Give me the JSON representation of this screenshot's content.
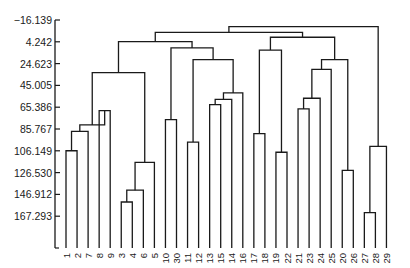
{
  "chart_data": {
    "type": "dendrogram",
    "title": "",
    "xlabel": "",
    "ylabel": "",
    "y_axis": {
      "ticks": [
        "-16.139",
        "4.242",
        "24.623",
        "45.005",
        "65.386",
        "85.767",
        "106.149",
        "126.530",
        "146.912",
        "167.293"
      ],
      "inverted": true,
      "range": [
        -16.139,
        193
      ]
    },
    "leaves": [
      "1",
      "2",
      "7",
      "8",
      "9",
      "3",
      "4",
      "6",
      "5",
      "10",
      "30",
      "11",
      "12",
      "13",
      "15",
      "14",
      "16",
      "17",
      "18",
      "19",
      "22",
      "21",
      "23",
      "24",
      "25",
      "20",
      "26",
      "27",
      "28",
      "29"
    ],
    "merges": [
      {
        "id": "a",
        "left": "L0",
        "right": "L1",
        "height": 106.1
      },
      {
        "id": "b",
        "left": "a",
        "right": "L2",
        "height": 88.0
      },
      {
        "id": "c",
        "left": "L5",
        "right": "L6",
        "height": 154.0
      },
      {
        "id": "d",
        "left": "c",
        "right": "L7",
        "height": 143.0
      },
      {
        "id": "e",
        "left": "d",
        "right": "L8",
        "height": 117.0
      },
      {
        "id": "f",
        "left": "L3",
        "right": "L4",
        "height": 68.5
      },
      {
        "id": "g",
        "left": "b",
        "right": "f",
        "height": 82.0
      },
      {
        "id": "h",
        "left": "g",
        "right": "e",
        "height": 33.0
      },
      {
        "id": "i",
        "left": "L9",
        "right": "L10",
        "height": 77.0
      },
      {
        "id": "j",
        "left": "L11",
        "right": "L12",
        "height": 98.0
      },
      {
        "id": "k",
        "left": "L13",
        "right": "L14",
        "height": 63.0
      },
      {
        "id": "l",
        "left": "k",
        "right": "L15",
        "height": 58.0
      },
      {
        "id": "m",
        "left": "l",
        "right": "L16",
        "height": 52.0
      },
      {
        "id": "n",
        "left": "j",
        "right": "m",
        "height": 21.0
      },
      {
        "id": "o",
        "left": "i",
        "right": "n",
        "height": 10.0
      },
      {
        "id": "p",
        "left": "h",
        "right": "o",
        "height": 4.0
      },
      {
        "id": "q",
        "left": "L17",
        "right": "L18",
        "height": 90.0
      },
      {
        "id": "r",
        "left": "L19",
        "right": "L20",
        "height": 107.5
      },
      {
        "id": "s",
        "left": "L21",
        "right": "L22",
        "height": 67.0
      },
      {
        "id": "t",
        "left": "s",
        "right": "L23",
        "height": 57.0
      },
      {
        "id": "u",
        "left": "t",
        "right": "L24",
        "height": 30.0
      },
      {
        "id": "v",
        "left": "L25",
        "right": "L26",
        "height": 124.5
      },
      {
        "id": "w",
        "left": "u",
        "right": "v",
        "height": 21.0
      },
      {
        "id": "x",
        "left": "q",
        "right": "r",
        "height": 12.0
      },
      {
        "id": "y",
        "left": "x",
        "right": "w",
        "height": 0.0
      },
      {
        "id": "z",
        "left": "p",
        "right": "y",
        "height": -4.5
      },
      {
        "id": "aa",
        "left": "L27",
        "right": "L28",
        "height": 164.0
      },
      {
        "id": "bb",
        "left": "aa",
        "right": "L29",
        "height": 102.0
      },
      {
        "id": "cc",
        "left": "z",
        "right": "bb",
        "height": -10.0
      }
    ]
  }
}
